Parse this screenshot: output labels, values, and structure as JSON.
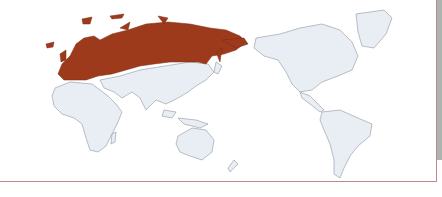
{
  "map": {
    "projection": "pacific-centered world map",
    "highlighted_region": "Europe and Russia",
    "colors": {
      "highlight": "#9e3a1c",
      "land": "#e9eef4",
      "border": "#8f969e",
      "frame": "#b98a86",
      "background": "#ffffff"
    },
    "regions": [
      {
        "name": "Europe",
        "highlighted": true
      },
      {
        "name": "Russia",
        "highlighted": true
      },
      {
        "name": "Africa",
        "highlighted": false
      },
      {
        "name": "Middle East & Asia",
        "highlighted": false
      },
      {
        "name": "Southeast Asia",
        "highlighted": false
      },
      {
        "name": "Australia",
        "highlighted": false
      },
      {
        "name": "New Zealand",
        "highlighted": false
      },
      {
        "name": "North America",
        "highlighted": false
      },
      {
        "name": "Greenland",
        "highlighted": false
      },
      {
        "name": "Central America",
        "highlighted": false
      },
      {
        "name": "South America",
        "highlighted": false
      }
    ]
  }
}
